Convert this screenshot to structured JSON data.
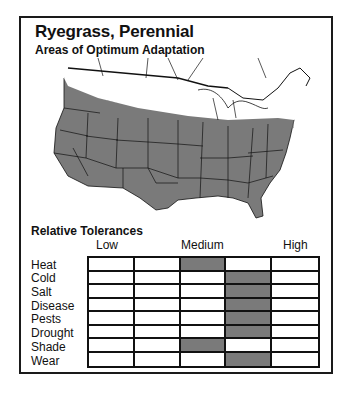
{
  "header": {
    "title": "Ryegrass, Perennial",
    "subtitle": "Areas of Optimum Adaptation"
  },
  "map": {
    "description": "Map of contiguous United States; shaded gray region covers the country except a white band along the northern border",
    "shaded_color": "#7a7a7a"
  },
  "chart_data": {
    "type": "table",
    "title": "Relative Tolerances",
    "scale_labels": [
      "Low",
      "Medium",
      "High"
    ],
    "columns": 5,
    "rows": [
      "Heat",
      "Cold",
      "Salt",
      "Disease",
      "Pests",
      "Drought",
      "Shade",
      "Wear"
    ],
    "values": [
      3,
      4,
      4,
      4,
      4,
      4,
      3,
      4
    ],
    "value_meaning": "1-based column index of shaded cell (1=Low, 3=Medium, 5=High)",
    "fill_color": "#7a7a7a"
  },
  "tolerances": {
    "title": "Relative Tolerances",
    "low": "Low",
    "medium": "Medium",
    "high": "High",
    "rows": [
      "Heat",
      "Cold",
      "Salt",
      "Disease",
      "Pests",
      "Drought",
      "Shade",
      "Wear"
    ]
  }
}
